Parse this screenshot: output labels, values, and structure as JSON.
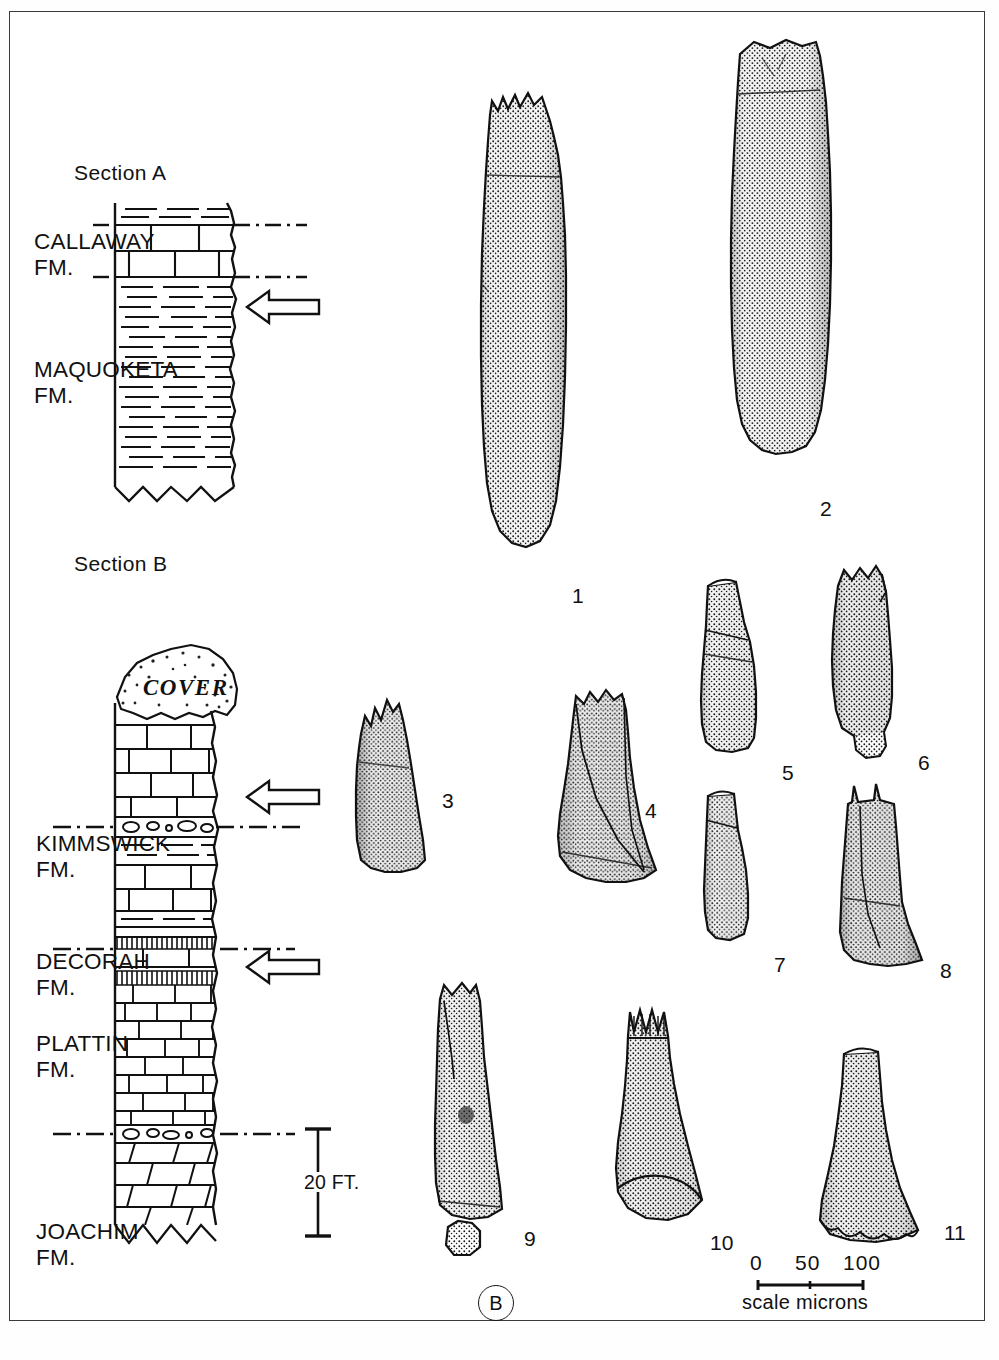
{
  "plate": {
    "panel_label": "B",
    "border_color": "#3a3a3a"
  },
  "sections": [
    {
      "id": "section-a",
      "title": "Section A",
      "units": [
        {
          "name": "CALLAWAY",
          "suffix": "FM.",
          "lithology": "limestone-shale"
        },
        {
          "name": "MAQUOKETA",
          "suffix": "FM.",
          "lithology": "shale"
        }
      ],
      "sample_arrows": 1
    },
    {
      "id": "section-b",
      "title": "Section B",
      "cover_label": "COVER",
      "units": [
        {
          "name": "KIMMSWICK",
          "suffix": "FM.",
          "lithology": "limestone"
        },
        {
          "name": "DECORAH",
          "suffix": "FM.",
          "lithology": "shaly-limestone"
        },
        {
          "name": "PLATTIN",
          "suffix": "FM.",
          "lithology": "limestone"
        },
        {
          "name": "JOACHIM",
          "suffix": "FM.",
          "lithology": "dolomite"
        }
      ],
      "sample_arrows": 2,
      "vertical_scale": {
        "value": "20",
        "unit": "FT.",
        "label": "20 FT."
      }
    }
  ],
  "specimens": [
    {
      "number": "1",
      "shape": "elongate-cylindrical-cone"
    },
    {
      "number": "2",
      "shape": "large-cylindrical-cone"
    },
    {
      "number": "3",
      "shape": "short-flared-cone"
    },
    {
      "number": "4",
      "shape": "broad-flared-cone"
    },
    {
      "number": "5",
      "shape": "constricted-cone"
    },
    {
      "number": "6",
      "shape": "tapered-cone"
    },
    {
      "number": "7",
      "shape": "small-constricted-cone"
    },
    {
      "number": "8",
      "shape": "flared-base-cone"
    },
    {
      "number": "9",
      "shape": "tall-tapered-cone"
    },
    {
      "number": "10",
      "shape": "conical-expanded-base"
    },
    {
      "number": "11",
      "shape": "bell-shaped-cone"
    }
  ],
  "scale_bar": {
    "ticks": [
      "0",
      "50",
      "100"
    ],
    "caption": "scale microns"
  }
}
